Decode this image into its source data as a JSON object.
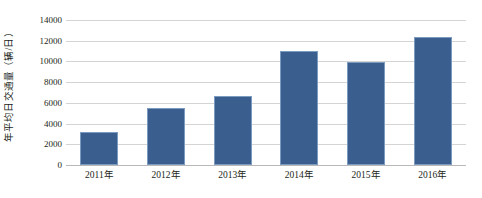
{
  "chart_data": {
    "type": "bar",
    "title": "",
    "subtitle": "",
    "xlabel": "",
    "ylabel": "年平均日交通量（辆/日）",
    "categories": [
      "2011年",
      "2012年",
      "2013年",
      "2014年",
      "2015年",
      "2016年"
    ],
    "values": [
      3200,
      5500,
      6700,
      11000,
      9900,
      12400
    ],
    "series": [
      {
        "name": "年平均日交通量",
        "values": [
          3200,
          5500,
          6700,
          11000,
          9900,
          12400
        ]
      }
    ],
    "ylim": [
      0,
      14000
    ],
    "y_ticks": [
      "0",
      "2000",
      "4000",
      "6000",
      "8000",
      "10000",
      "12000",
      "14000"
    ],
    "y_tick_values": [
      0,
      2000,
      4000,
      6000,
      8000,
      10000,
      12000,
      14000
    ],
    "grid": true,
    "legend": false,
    "legend_position": "none",
    "annotations": [],
    "colors": {
      "bar_fill": "#3a5f8e",
      "bar_border": "#7c9bc0",
      "gridline": "#d4d4d4",
      "axis_line": "#b8b8b8",
      "text": "#231f20",
      "background": "#ffffff"
    }
  }
}
